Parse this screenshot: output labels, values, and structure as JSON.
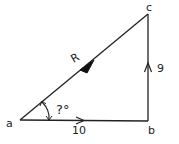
{
  "diagram": {
    "type": "vector-triangle",
    "vertices": {
      "a": {
        "label": "a",
        "x": 20,
        "y": 120
      },
      "b": {
        "label": "b",
        "x": 148,
        "y": 121
      },
      "c": {
        "label": "c",
        "x": 148,
        "y": 14
      }
    },
    "vectors": [
      {
        "from": "a",
        "to": "b",
        "label": "10"
      },
      {
        "from": "b",
        "to": "c",
        "label": "9"
      },
      {
        "from": "a",
        "to": "c",
        "label": "R"
      }
    ],
    "angle": {
      "at": "a",
      "label": "?°"
    },
    "colors": {
      "stroke": "#222222",
      "background": "#ffffff"
    }
  }
}
